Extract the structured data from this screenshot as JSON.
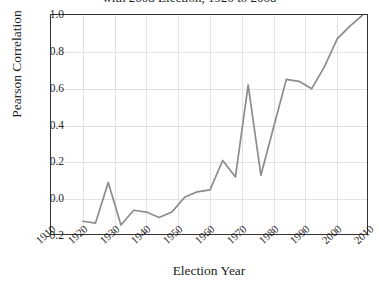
{
  "chart_data": {
    "type": "line",
    "title": "with 2008 Election, 1920 to 2008",
    "xlabel": "Election Year",
    "ylabel": "Pearson Correlation",
    "xlim": [
      1910,
      2010
    ],
    "ylim": [
      -0.2,
      1.0
    ],
    "grid": true,
    "legend_position": "none",
    "line_color": "#8c8c8c",
    "x_tick_labels": [
      "1910",
      "1920",
      "1930",
      "1940",
      "1950",
      "1960",
      "1970",
      "1980",
      "1990",
      "2000",
      "2010"
    ],
    "y_tick_labels": [
      "-0.2",
      "0.0",
      "0.2",
      "0.4",
      "0.6",
      "0.8",
      "1.0"
    ],
    "x_ticks": [
      1910,
      1920,
      1930,
      1940,
      1950,
      1960,
      1970,
      1980,
      1990,
      2000,
      2010
    ],
    "y_ticks": [
      -0.2,
      0.0,
      0.2,
      0.4,
      0.6,
      0.8,
      1.0
    ],
    "series": [
      {
        "name": "Pearson Correlation",
        "x": [
          1920,
          1924,
          1928,
          1932,
          1936,
          1940,
          1944,
          1948,
          1952,
          1956,
          1960,
          1964,
          1968,
          1972,
          1976,
          1980,
          1984,
          1988,
          1992,
          1996,
          2000,
          2004,
          2008
        ],
        "values": [
          -0.12,
          -0.13,
          0.09,
          -0.14,
          -0.06,
          -0.07,
          -0.1,
          -0.07,
          0.01,
          0.04,
          0.05,
          0.21,
          0.12,
          0.62,
          0.13,
          0.39,
          0.65,
          0.64,
          0.6,
          0.72,
          0.87,
          0.94,
          1.0
        ]
      }
    ]
  }
}
